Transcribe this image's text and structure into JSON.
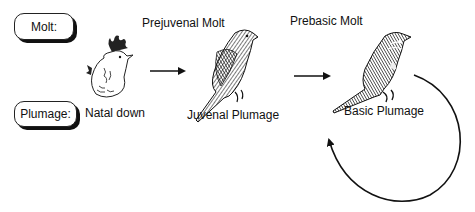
{
  "diagram": {
    "type": "life-cycle",
    "row_labels": {
      "molt": "Molt:",
      "plumage": "Plumage:"
    },
    "stages": [
      {
        "plumage": "Natal down",
        "icon": "chick-icon"
      },
      {
        "molt": "Prejuvenal Molt",
        "plumage": "Juvenal Plumage",
        "icon": "juvenile-bird-icon"
      },
      {
        "molt": "Prebasic Molt",
        "plumage": "Basic Plumage",
        "icon": "adult-bird-icon"
      }
    ],
    "arrows": [
      {
        "from": "Natal down",
        "to": "Juvenal Plumage"
      },
      {
        "from": "Juvenal Plumage",
        "to": "Basic Plumage"
      },
      {
        "from": "Basic Plumage",
        "to": "Basic Plumage",
        "style": "cycle"
      }
    ]
  }
}
